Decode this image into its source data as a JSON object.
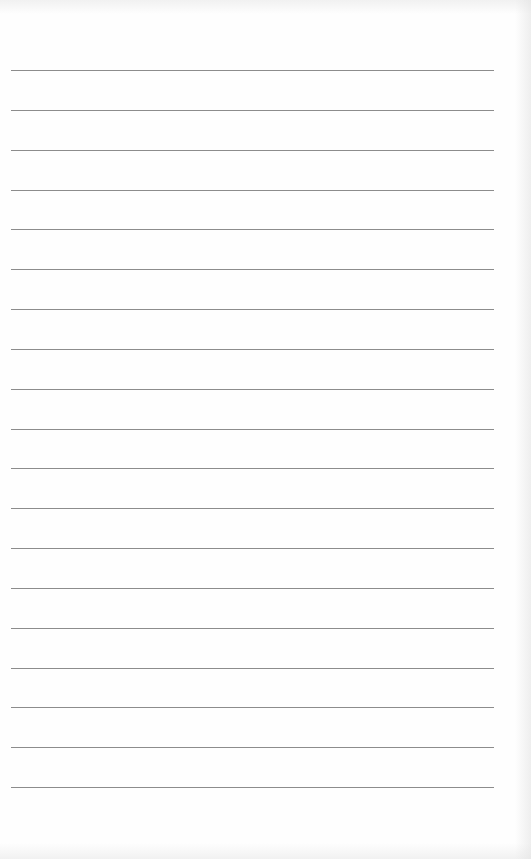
{
  "document": {
    "type": "ruled-notebook-page",
    "line_count": 19,
    "line_color": "#8c8c8c",
    "paper_color": "#fefefe",
    "text_content": []
  }
}
